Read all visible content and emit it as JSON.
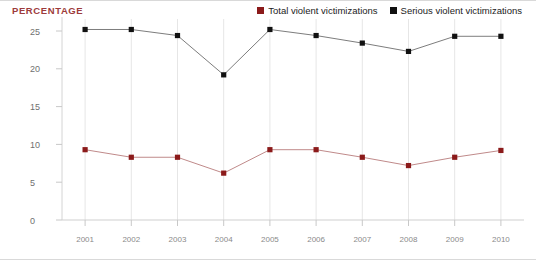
{
  "axis_title": "PERCENTAGE",
  "legend": {
    "items": [
      {
        "label": "Total violent victimizations",
        "color": "#8B1A1A",
        "marker": "square"
      },
      {
        "label": "Serious violent victimizations",
        "color": "#111111",
        "marker": "square"
      }
    ]
  },
  "chart_data": {
    "type": "line",
    "title": "PERCENTAGE",
    "xlabel": "",
    "ylabel": "PERCENTAGE",
    "categories": [
      "2001",
      "2002",
      "2003",
      "2004",
      "2005",
      "2006",
      "2007",
      "2008",
      "2009",
      "2010"
    ],
    "x": [
      2001,
      2002,
      2003,
      2004,
      2005,
      2006,
      2007,
      2008,
      2009,
      2010
    ],
    "ylim": [
      0,
      27
    ],
    "yticks": [
      0,
      5,
      10,
      15,
      20,
      25
    ],
    "ytick_labels": [
      "0",
      "5",
      "10",
      "15",
      "20",
      "25"
    ],
    "grid": "vertical",
    "legend_position": "top-right",
    "series": [
      {
        "name": "Total violent victimizations",
        "color": "#8B1A1A",
        "line_color": "#c08a8a",
        "values": [
          9.3,
          8.3,
          8.3,
          6.2,
          9.3,
          9.3,
          8.3,
          7.2,
          8.3,
          9.2
        ]
      },
      {
        "name": "Serious violent victimizations",
        "color": "#111111",
        "line_color": "#7d7d7d",
        "values": [
          25.2,
          25.2,
          24.4,
          19.2,
          25.2,
          24.4,
          23.4,
          22.3,
          24.3,
          24.3
        ]
      }
    ]
  }
}
